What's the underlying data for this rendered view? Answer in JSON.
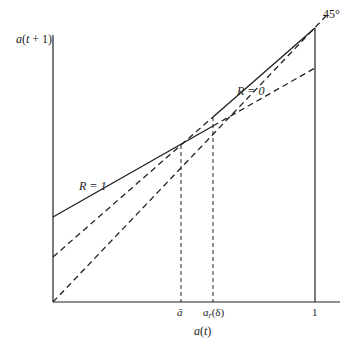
{
  "diagram": {
    "type": "line-diagram",
    "axes": {
      "y_label": "a(t + 1)",
      "x_label": "a(t)",
      "x_ticks": [
        {
          "label": "â",
          "value": "a_hat"
        },
        {
          "label": "a_r(δ)",
          "value": "a_r_delta"
        },
        {
          "label": "1",
          "value": 1
        }
      ]
    },
    "lines": [
      {
        "name": "R = 1",
        "style": "solid then dashed",
        "label": "R = 1"
      },
      {
        "name": "R = 0",
        "style": "dashed then solid",
        "label": "R = 0"
      },
      {
        "name": "45°",
        "style": "dashed",
        "label": "45°"
      }
    ],
    "labels": {
      "r1": "R = 1",
      "r0": "R = 0",
      "deg45": "45°",
      "a_hat": "â",
      "a_r_main": "a",
      "a_r_sub": "r",
      "a_r_arg": "(δ)",
      "one": "1",
      "x_axis": "a(t)",
      "y_axis": "a(t + 1)"
    },
    "colors": {
      "ink": "#222222",
      "background": "#ffffff"
    }
  }
}
